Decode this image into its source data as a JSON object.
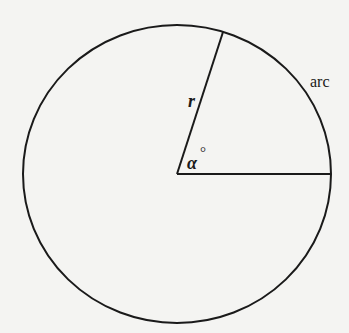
{
  "diagram": {
    "type": "circle-sector",
    "stroke_color": "#1a1a1a",
    "background": "#f4f4f2",
    "circle": {
      "cx": 177,
      "cy": 174,
      "rx": 154,
      "ry": 149
    },
    "radius_line": {
      "x1": 177,
      "y1": 174,
      "x2": 223,
      "y2": 32
    },
    "horizontal_line": {
      "x1": 177,
      "y1": 174,
      "x2": 330,
      "y2": 174
    },
    "labels": {
      "radius": "r",
      "angle": "α",
      "degree": "°",
      "arc": "arc"
    }
  }
}
